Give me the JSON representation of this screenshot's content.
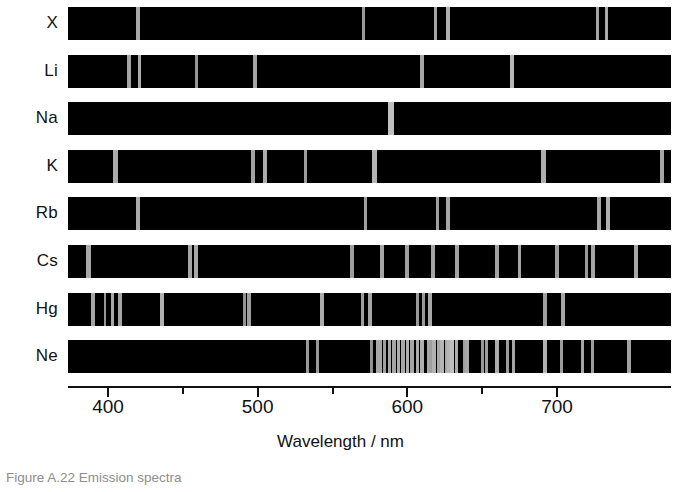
{
  "figure": {
    "title_caption": "Figure   A.22 Emission spectra",
    "axis": {
      "title": "Wavelength / nm",
      "unit": "nm",
      "tick_labels": [
        "400",
        "500",
        "600",
        "700"
      ],
      "labeled_ticks": [
        400,
        500,
        600,
        700
      ],
      "minor_ticks": [
        450,
        550,
        650
      ],
      "range_nm": [
        373,
        776
      ]
    }
  },
  "chart_data": {
    "type": "line",
    "title": "Emission spectra",
    "xlabel": "Wavelength / nm",
    "ylabel": "",
    "xlim": [
      373,
      776
    ],
    "grid": false,
    "legend": "none",
    "x_tick_labels": [
      "400",
      "500",
      "600",
      "700"
    ],
    "x_major_ticks": [
      400,
      500,
      600,
      700
    ],
    "x_minor_ticks": [
      450,
      550,
      650
    ],
    "colors": {
      "background_band": "#000000",
      "emission_line": "#b4b4b4",
      "emission_line_bright": "#d8d8d8",
      "page_background": "#ffffff",
      "text": "#111111"
    },
    "series": [
      {
        "name": "X",
        "label": "X",
        "lines_nm": [
          420,
          571,
          619,
          627,
          727,
          733
        ],
        "line_widths_nm": [
          2.5,
          2.0,
          2.0,
          2.5,
          2.0,
          2.5
        ],
        "line_intensities": [
          0.72,
          0.62,
          0.7,
          0.78,
          0.7,
          0.74
        ]
      },
      {
        "name": "Li",
        "label": "Li",
        "lines_nm": [
          414,
          421,
          459,
          498,
          610,
          670
        ],
        "line_widths_nm": [
          2.5,
          2.5,
          2.0,
          2.5,
          2.5,
          3.0
        ],
        "line_intensities": [
          0.7,
          0.74,
          0.6,
          0.7,
          0.7,
          0.82
        ]
      },
      {
        "name": "Na",
        "label": "Na",
        "lines_nm": [
          589
        ],
        "line_widths_nm": [
          4.0
        ],
        "line_intensities": [
          0.88
        ]
      },
      {
        "name": "K",
        "label": "K",
        "lines_nm": [
          405,
          497,
          505,
          532,
          578,
          691,
          770
        ],
        "line_widths_nm": [
          3.0,
          2.5,
          3.0,
          2.5,
          3.5,
          3.0,
          2.5
        ],
        "line_intensities": [
          0.74,
          0.68,
          0.74,
          0.64,
          0.8,
          0.76,
          0.7
        ]
      },
      {
        "name": "Rb",
        "label": "Rb",
        "lines_nm": [
          420,
          572,
          620,
          627,
          728,
          734
        ],
        "line_widths_nm": [
          3.0,
          2.5,
          2.0,
          2.5,
          2.5,
          3.0
        ],
        "line_intensities": [
          0.74,
          0.66,
          0.66,
          0.7,
          0.72,
          0.78
        ]
      },
      {
        "name": "Cs",
        "label": "Cs",
        "lines_nm": [
          387,
          455,
          459,
          563,
          583,
          600,
          617,
          633,
          660,
          675,
          700,
          720,
          724,
          753
        ],
        "line_widths_nm": [
          3.0,
          2.5,
          2.5,
          2.5,
          2.5,
          2.5,
          2.5,
          2.5,
          2.5,
          2.5,
          2.5,
          2.0,
          2.5,
          2.5
        ],
        "line_intensities": [
          0.72,
          0.7,
          0.72,
          0.66,
          0.7,
          0.66,
          0.7,
          0.68,
          0.68,
          0.7,
          0.66,
          0.62,
          0.7,
          0.72
        ]
      },
      {
        "name": "Hg",
        "label": "Hg",
        "lines_nm": [
          390,
          398,
          403,
          408,
          436,
          491,
          494,
          543,
          570,
          575,
          607,
          611,
          615,
          692,
          704
        ],
        "line_widths_nm": [
          2.5,
          2.0,
          2.5,
          2.5,
          3.0,
          2.0,
          2.5,
          3.0,
          2.5,
          2.5,
          2.0,
          2.0,
          2.5,
          2.5,
          2.5
        ],
        "line_intensities": [
          0.7,
          0.6,
          0.72,
          0.7,
          0.78,
          0.58,
          0.66,
          0.74,
          0.66,
          0.7,
          0.62,
          0.62,
          0.72,
          0.66,
          0.7
        ]
      },
      {
        "name": "Ne",
        "label": "Ne",
        "lines_nm": [
          533,
          540,
          576,
          581,
          585,
          588,
          591,
          594,
          597,
          600,
          603,
          607,
          610,
          614,
          616,
          618,
          621,
          623,
          626,
          628,
          630,
          633,
          638,
          640,
          650,
          653,
          660,
          667,
          671,
          692,
          703,
          717,
          724,
          748
        ],
        "line_widths_nm": [
          2.0,
          2.0,
          2.0,
          3.5,
          2.0,
          2.0,
          2.5,
          2.0,
          2.5,
          2.0,
          2.5,
          2.0,
          2.5,
          2.0,
          2.0,
          2.5,
          2.0,
          2.5,
          2.0,
          2.5,
          3.0,
          2.0,
          2.0,
          2.5,
          2.0,
          2.0,
          2.5,
          2.0,
          2.5,
          3.0,
          2.0,
          2.5,
          2.0,
          2.5
        ],
        "line_intensities": [
          0.62,
          0.62,
          0.58,
          0.72,
          0.66,
          0.72,
          0.7,
          0.76,
          0.72,
          0.78,
          0.7,
          0.74,
          0.76,
          0.7,
          0.66,
          0.78,
          0.72,
          0.8,
          0.74,
          0.82,
          0.88,
          0.76,
          0.66,
          0.72,
          0.62,
          0.66,
          0.74,
          0.64,
          0.7,
          0.78,
          0.64,
          0.7,
          0.64,
          0.68
        ]
      }
    ]
  }
}
